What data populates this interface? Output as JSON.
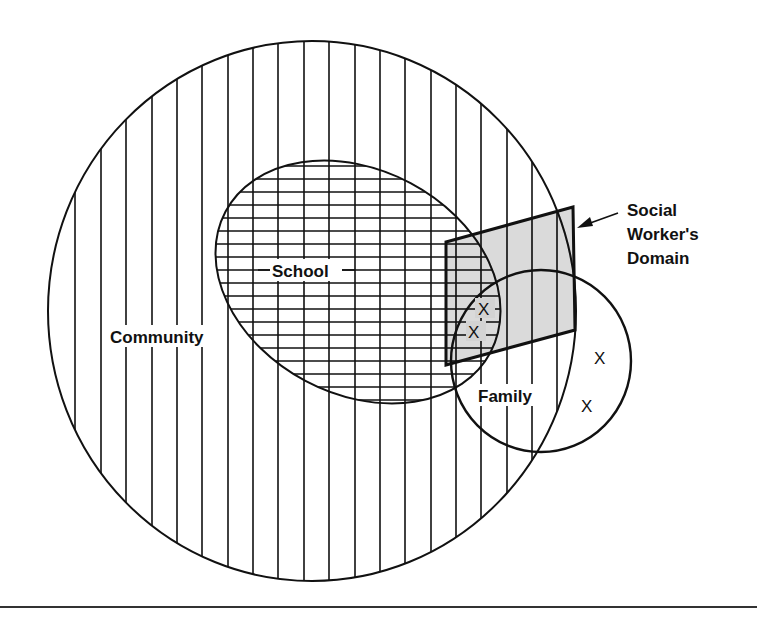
{
  "diagram": {
    "type": "venn",
    "colors": {
      "ink": "#111111",
      "background": "#ffffff",
      "domain_fill": "#d3d3d3",
      "bottom_rule": "#333333"
    },
    "sets": {
      "community": {
        "label": "Community",
        "pattern": "vertical-lines"
      },
      "school": {
        "label": "School",
        "pattern": "crosshatch-horizontal-lines"
      },
      "family": {
        "label": "Family",
        "pattern": "none"
      },
      "social_worker_domain": {
        "label_line1": "Social",
        "label_line2": "Worker's",
        "label_line3": "Domain",
        "pattern": "gray-fill"
      }
    },
    "markers": [
      {
        "id": "x1",
        "text": "X",
        "region": "school-family-domain"
      },
      {
        "id": "x2",
        "text": "X",
        "region": "school-family-domain"
      },
      {
        "id": "x3",
        "text": "X",
        "region": "family-only"
      },
      {
        "id": "x4",
        "text": "X",
        "region": "family-only"
      }
    ]
  }
}
